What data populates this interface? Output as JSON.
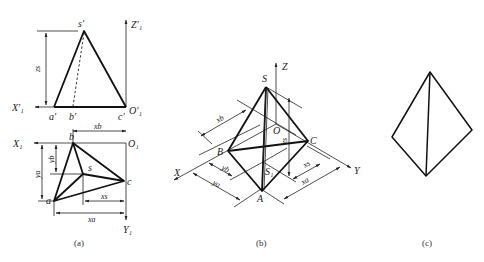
{
  "figure": {
    "panels": [
      {
        "id": "a",
        "caption": "(a)",
        "front_view_labels": {
          "apex": "s′",
          "a": "a′",
          "b": "b′",
          "c": "c′",
          "axis_z": "Z′₁",
          "axis_x": "X′₁",
          "origin": "O′₁",
          "height_dim": "zs"
        },
        "top_view_labels": {
          "apex": "s",
          "a": "a",
          "b": "b",
          "c": "c",
          "axis_x": "X₁",
          "axis_y": "Y₁",
          "origin": "O₁",
          "dim_xb": "xb",
          "dim_ya": "ya",
          "dim_yb": "yb",
          "dim_xs": "xs",
          "dim_xa": "xa"
        }
      },
      {
        "id": "b",
        "caption": "(b)",
        "labels": {
          "apex": "S",
          "A": "A",
          "B": "B",
          "C": "C",
          "S1": "S₁",
          "origin": "O",
          "axis_x": "X",
          "axis_y": "Y",
          "axis_z": "Z",
          "dim_xb": "xb",
          "dim_yb": "yb",
          "dim_ya": "ya",
          "dim_xs": "xs",
          "dim_xa": "xa",
          "dim_zs": "zs"
        }
      },
      {
        "id": "c",
        "caption": "(c)"
      }
    ]
  }
}
